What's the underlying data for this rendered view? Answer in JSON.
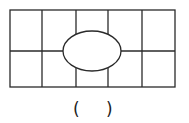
{
  "figure": {
    "stroke_color": "#2a2a2a",
    "grid": {
      "columns": 5,
      "rows": 2
    },
    "outer_rect": {
      "x": 10,
      "y": 10,
      "width": 165,
      "height": 77
    },
    "vertical_lines_x": [
      42,
      76,
      108,
      142
    ],
    "horizontal_line_y": 51,
    "ellipse": {
      "cx": 92,
      "cy": 51,
      "rx": 29,
      "ry": 20
    }
  },
  "answer": {
    "open_paren": "(",
    "blank": "",
    "close_paren": ")"
  }
}
